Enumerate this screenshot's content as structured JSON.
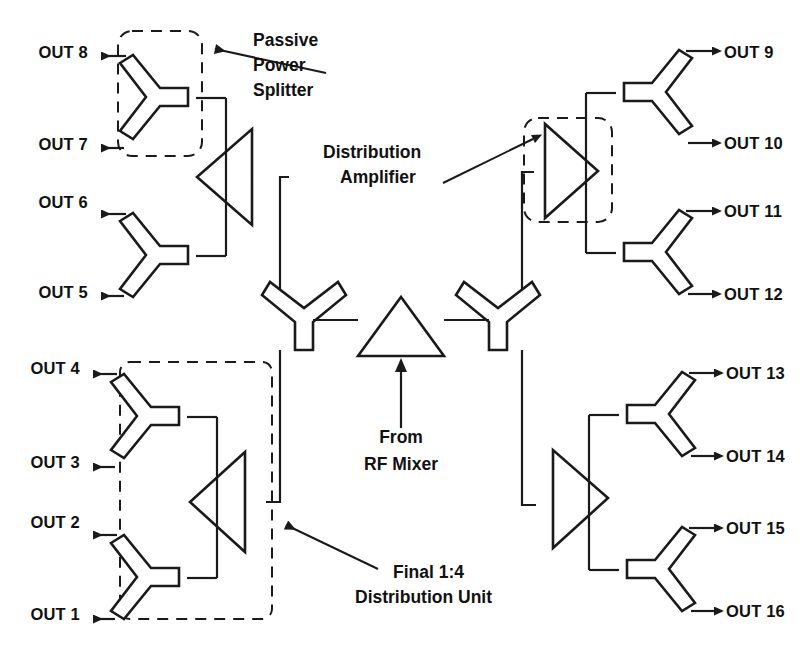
{
  "diagram": {
    "colors": {
      "ink": "#1a1a1a",
      "background": "#ffffff"
    },
    "source": {
      "name": "rf-mixer-source",
      "label_line1": "From",
      "label_line2": "RF Mixer"
    },
    "callouts": [
      {
        "id": "passive-power-splitter",
        "lines": [
          "Passive",
          "Power",
          "Splitter"
        ]
      },
      {
        "id": "distribution-amplifier",
        "lines": [
          "Distribution",
          "Amplifier"
        ]
      },
      {
        "id": "final-distribution-unit",
        "lines": [
          "Final 1:4",
          "Distribution Unit"
        ]
      }
    ],
    "outputs_left": [
      {
        "id": "out-8",
        "label": "OUT 8",
        "y": 52
      },
      {
        "id": "out-7",
        "label": "OUT 7",
        "y": 144
      },
      {
        "id": "out-6",
        "label": "OUT 6",
        "y": 202
      },
      {
        "id": "out-5",
        "label": "OUT 5",
        "y": 292
      },
      {
        "id": "out-4",
        "label": "OUT 4",
        "y": 368
      },
      {
        "id": "out-3",
        "label": "OUT 3",
        "y": 462
      },
      {
        "id": "out-2",
        "label": "OUT 2",
        "y": 522
      },
      {
        "id": "out-1",
        "label": "OUT 1",
        "y": 614
      }
    ],
    "outputs_right": [
      {
        "id": "out-9",
        "label": "OUT 9",
        "y": 52
      },
      {
        "id": "out-10",
        "label": "OUT 10",
        "y": 143
      },
      {
        "id": "out-11",
        "label": "OUT 11",
        "y": 205
      },
      {
        "id": "out-12",
        "label": "OUT 12",
        "y": 294
      },
      {
        "id": "out-13",
        "label": "OUT 13",
        "y": 368
      },
      {
        "id": "out-14",
        "label": "OUT 14",
        "y": 452
      },
      {
        "id": "out-15",
        "label": "OUT 15",
        "y": 510
      },
      {
        "id": "out-16",
        "label": "OUT 16",
        "y": 605
      }
    ],
    "amplifiers": [
      {
        "id": "amp-upper-left",
        "direction": "left"
      },
      {
        "id": "amp-lower-left",
        "direction": "left"
      },
      {
        "id": "amp-upper-right",
        "direction": "right"
      },
      {
        "id": "amp-lower-right",
        "direction": "right"
      }
    ],
    "splitters": [
      {
        "id": "splitter-out-7-8",
        "orientation": "left"
      },
      {
        "id": "splitter-out-5-6",
        "orientation": "left"
      },
      {
        "id": "splitter-out-3-4",
        "orientation": "left"
      },
      {
        "id": "splitter-out-1-2",
        "orientation": "left"
      },
      {
        "id": "splitter-out-9-10",
        "orientation": "right"
      },
      {
        "id": "splitter-out-11-12",
        "orientation": "right"
      },
      {
        "id": "splitter-out-13-14",
        "orientation": "right"
      },
      {
        "id": "splitter-out-15-16",
        "orientation": "right"
      },
      {
        "id": "splitter-trunk-left",
        "orientation": "vertical-left"
      },
      {
        "id": "splitter-trunk-right",
        "orientation": "vertical-right"
      }
    ]
  }
}
